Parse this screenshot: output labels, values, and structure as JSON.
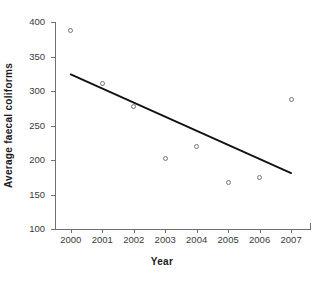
{
  "chart_data": {
    "type": "scatter",
    "title": "",
    "xlabel": "Year",
    "ylabel": "Average faecal coliforms",
    "categories": [
      "2000",
      "2001",
      "2002",
      "2003",
      "2004",
      "2005",
      "2006",
      "2007"
    ],
    "x": [
      2000,
      2001,
      2002,
      2003,
      2004,
      2005,
      2006,
      2007
    ],
    "values": [
      388,
      311,
      278,
      202,
      219,
      167,
      174,
      287
    ],
    "series": [
      {
        "name": "Average faecal coliforms",
        "values": [
          388,
          311,
          278,
          202,
          219,
          167,
          174,
          287
        ]
      }
    ],
    "trendline": {
      "type": "linear",
      "x_start": 2000,
      "y_start": 324,
      "x_end": 2007,
      "y_end": 181
    },
    "xlim": [
      1999.5,
      2007.6
    ],
    "ylim": [
      100,
      400
    ],
    "ytick_labels": [
      "400",
      "350",
      "300",
      "250",
      "200",
      "150",
      "100"
    ],
    "ytick_values": [
      400,
      350,
      300,
      250,
      200,
      150,
      100
    ],
    "xtick_labels": [
      "2000",
      "2001",
      "2002",
      "2003",
      "2004",
      "2005",
      "2006",
      "2007"
    ],
    "grid": false,
    "legend": false,
    "legend_position": "none",
    "marker": "open-circle",
    "colors": {
      "axis": "#6f6f6f",
      "marker_edge": "#777777",
      "trendline": "#111111",
      "text": "#1a1a1a",
      "tick_text": "#3a3a3a",
      "background": "#ffffff"
    }
  }
}
